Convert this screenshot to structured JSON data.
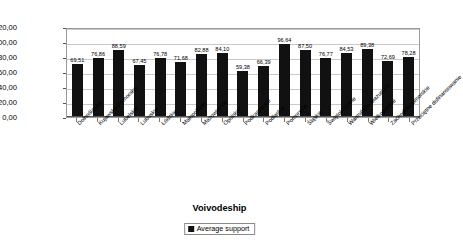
{
  "chart_data": {
    "type": "bar",
    "title": "",
    "xlabel": "Voivodeship",
    "ylabel": "Financial support (thous. PLN)",
    "ylim": [
      0,
      120
    ],
    "ytick_labels": [
      "120,00",
      "100,00",
      "80,00",
      "60,00",
      "40,00",
      "20,00",
      "0,00"
    ],
    "ytick_values": [
      120,
      100,
      80,
      60,
      40,
      20,
      0
    ],
    "grid": true,
    "legend_position": "bottom-center",
    "legend": [
      "Average support"
    ],
    "categories": [
      "Dolnośląskie",
      "Kujawsko-Pomorskie",
      "Lubelskie",
      "Lubuskie",
      "Łódzkie",
      "Małopolskie",
      "Mazowieckie",
      "Opolskie",
      "Podkarpackie",
      "Podlaskie",
      "Pomorskie",
      "Śląskie",
      "Świętokrzyskie",
      "Warmińsko-Mazurskie",
      "Wielkopolskie",
      "Zachodniopomorskie",
      "Przeciętne dofinansowanie"
    ],
    "values": [
      69.51,
      76.86,
      88.59,
      67.45,
      76.78,
      71.68,
      82.88,
      84.1,
      59.38,
      66.39,
      96.64,
      87.5,
      76.77,
      84.53,
      89.38,
      72.69,
      78.28
    ],
    "value_labels": [
      "69,51",
      "76,86",
      "88,59",
      "67,45",
      "76,78",
      "71,68",
      "82,88",
      "84,10",
      "59,38",
      "66,39",
      "96,64",
      "87,50",
      "76,77",
      "84,53",
      "89,38",
      "72,69",
      "78,28"
    ],
    "series": [
      {
        "name": "Average support",
        "color": "#111111",
        "values": [
          69.51,
          76.86,
          88.59,
          67.45,
          76.78,
          71.68,
          82.88,
          84.1,
          59.38,
          66.39,
          96.64,
          87.5,
          76.77,
          84.53,
          89.38,
          72.69,
          78.28
        ]
      }
    ],
    "colors": {
      "bar": "#111111",
      "grid": "#c9c9c9",
      "axis": "#555555",
      "background": "#ffffff"
    }
  }
}
